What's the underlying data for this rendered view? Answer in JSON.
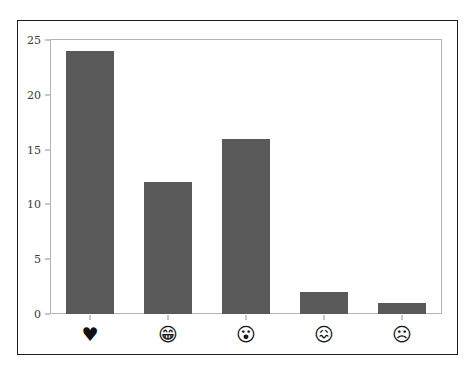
{
  "figure": {
    "ghost_text": "",
    "plot_border_color": "#b4b4b4",
    "frame_border_color": "#1c1c1c",
    "background_color": "#ffffff"
  },
  "chart_data": {
    "type": "bar",
    "title": "",
    "xlabel": "",
    "ylabel": "",
    "categories": [
      "♥",
      "😁",
      "😮",
      "😖",
      "☹"
    ],
    "category_names": [
      "heart-emoji",
      "grinning-face-with-smiling-eyes-emoji",
      "face-with-open-mouth-emoji",
      "confounded-face-emoji",
      "frowning-face-emoji"
    ],
    "values": [
      24,
      12,
      16,
      2,
      1
    ],
    "ylim": [
      0,
      25
    ],
    "yticks": [
      0,
      5,
      10,
      15,
      20,
      25
    ],
    "ytick_labels": [
      "0",
      "5",
      "10",
      "15",
      "20",
      "25"
    ],
    "grid": false,
    "legend": null,
    "bar_color": "#595959",
    "bar_width_ratio": 0.62
  }
}
